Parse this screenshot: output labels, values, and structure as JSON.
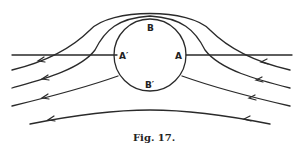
{
  "figure": {
    "caption": "Fig. 17.",
    "labels": {
      "top": "B",
      "bottom": "B′",
      "left": "A′",
      "right": "A"
    },
    "flow_direction": "right-to-left",
    "streamline_count": 6
  }
}
